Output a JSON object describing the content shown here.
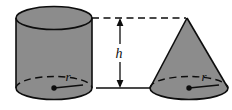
{
  "figure": {
    "background_color": "#ffffff",
    "solid_fill_color": "#8c8c8c",
    "outline_color": "#0d0d0d",
    "labels": {
      "height": "h",
      "radius_cylinder": "r",
      "radius_cone": "r"
    },
    "shapes": [
      {
        "name": "cylinder",
        "kind": "cylinder",
        "fill": "#8c8c8c",
        "stroke": "#0d0d0d",
        "center_x": 54,
        "radius_x": 38,
        "radius_y": 11.5,
        "top_y": 18,
        "bottom_y": 88,
        "has_center_dot": true,
        "hidden_back_arc": "dashed",
        "radius_label": "r"
      },
      {
        "name": "cone",
        "kind": "cone",
        "fill": "#8c8c8c",
        "stroke": "#0d0d0d",
        "apex_x": 187,
        "apex_y": 18,
        "center_x": 189,
        "radius_x": 39,
        "radius_y": 11.5,
        "base_y": 88,
        "has_center_dot": true,
        "hidden_back_arc": "dashed",
        "radius_label": "r"
      }
    ],
    "dimension": {
      "name": "height-dimension",
      "label": "h",
      "arrow_x": 120,
      "top_y": 18,
      "bottom_y": 88,
      "top_leader_style": "dashed",
      "bottom_leader_style": "solid",
      "top_leader_x1": 92,
      "top_leader_x2": 186,
      "bottom_leader_x1": 96,
      "bottom_leader_x2": 150
    }
  }
}
